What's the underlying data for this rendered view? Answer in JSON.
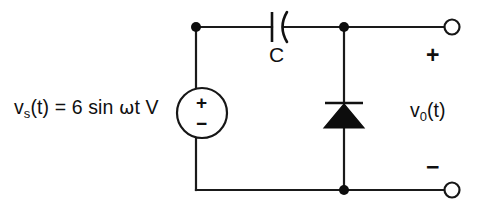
{
  "diagram": {
    "background_color": "#ffffff",
    "line_color": "#111111"
  },
  "source": {
    "label_prefix": "v",
    "label_subscript": "s",
    "label_rest": "(t) = 6 sin ",
    "omega": "ω",
    "label_tail": "t V",
    "full_text": "v_s(t) = 6 sin ωt V",
    "amplitude": "6",
    "unit": "V",
    "waveform": "sin",
    "plus_sign": "+",
    "minus_sign": "−",
    "symbol": "ac-voltage-source"
  },
  "capacitor": {
    "label": "C",
    "symbol": "polarized-capacitor"
  },
  "diode": {
    "symbol": "diode",
    "orientation": "anode-bottom-cathode-top"
  },
  "output": {
    "label_prefix": "v",
    "label_subscript": "0",
    "label_rest": "(t)",
    "full_text": "v_0(t)",
    "plus_sign": "+",
    "minus_sign": "−",
    "terminal_top": "open-terminal",
    "terminal_bottom": "open-terminal"
  },
  "nodes": {
    "top_left": "junction-dot",
    "top_right": "junction-dot",
    "bottom_right": "junction-dot"
  }
}
